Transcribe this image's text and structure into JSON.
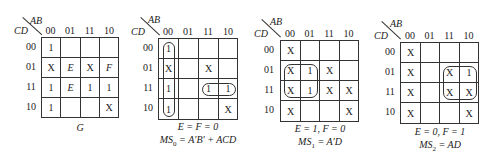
{
  "maps": [
    {
      "id": "G",
      "corner": {
        "col_var": "AB",
        "row_var": "CD"
      },
      "col_headers": [
        "00",
        "01",
        "11",
        "10"
      ],
      "row_headers": [
        "00",
        "01",
        "11",
        "10"
      ],
      "cells": [
        [
          "1",
          "",
          "",
          ""
        ],
        [
          "X",
          "E",
          "X",
          "F"
        ],
        [
          "1",
          "E",
          "1",
          "1"
        ],
        [
          "1",
          "",
          "",
          "X"
        ]
      ],
      "caption_line1": "G",
      "caption_line2": ""
    },
    {
      "id": "MS0",
      "corner": {
        "col_var": "AB",
        "row_var": "CD"
      },
      "col_headers": [
        "00",
        "01",
        "11",
        "10"
      ],
      "row_headers": [
        "00",
        "01",
        "11",
        "10"
      ],
      "cells": [
        [
          "1",
          "",
          "",
          ""
        ],
        [
          "X",
          "",
          "X",
          ""
        ],
        [
          "1",
          "",
          "1",
          "1"
        ],
        [
          "1",
          "",
          "",
          "X"
        ]
      ],
      "loops": [
        "col 00 rows 00-10",
        "row 11 cols 11-10"
      ],
      "caption_line1": "E = F = 0",
      "caption_line2_prefix": "MS",
      "caption_line2_sub": "0",
      "caption_line2_rest": " = A'B' + ACD"
    },
    {
      "id": "MS1",
      "corner": {
        "col_var": "AB",
        "row_var": "CD"
      },
      "col_headers": [
        "00",
        "01",
        "11",
        "10"
      ],
      "row_headers": [
        "00",
        "01",
        "11",
        "10"
      ],
      "cells": [
        [
          "X",
          "",
          "",
          ""
        ],
        [
          "X",
          "1",
          "X",
          ""
        ],
        [
          "X",
          "1",
          "X",
          "X"
        ],
        [
          "X",
          "",
          "",
          "X"
        ]
      ],
      "loops": [
        "rows 01-11 cols 00-01"
      ],
      "caption_line1": "E = 1, F = 0",
      "caption_line2_prefix": "MS",
      "caption_line2_sub": "1",
      "caption_line2_rest": " = A'D"
    },
    {
      "id": "MS2",
      "corner": {
        "col_var": "AB",
        "row_var": "CD"
      },
      "col_headers": [
        "00",
        "01",
        "11",
        "10"
      ],
      "row_headers": [
        "00",
        "01",
        "11",
        "10"
      ],
      "cells": [
        [
          "X",
          "",
          "",
          ""
        ],
        [
          "X",
          "",
          "X",
          "1"
        ],
        [
          "X",
          "",
          "X",
          "X"
        ],
        [
          "X",
          "",
          "",
          "X"
        ]
      ],
      "loops": [
        "rows 01-11 cols 11-10"
      ],
      "caption_line1": "E = 0, F = 1",
      "caption_line2_prefix": "MS",
      "caption_line2_sub": "2",
      "caption_line2_rest": " = AD"
    }
  ]
}
